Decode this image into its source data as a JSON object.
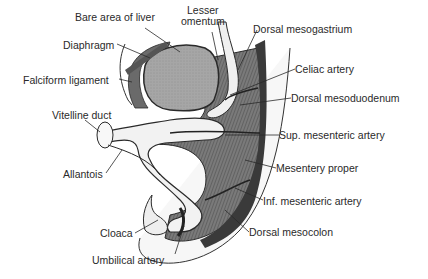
{
  "diagram": {
    "colors": {
      "background": "#ffffff",
      "line": "#2a2a2a",
      "liver": "#a8a8a8",
      "mesentery": "#6e6e6e",
      "gut_lumen": "#f2f2f2",
      "body_wall": "#f5f5f5"
    },
    "labels": [
      {
        "id": "bare-area-of-liver",
        "text": "Bare area of liver",
        "x": 75,
        "y": 17
      },
      {
        "id": "lesser-omentum-1",
        "text": "Lesser",
        "x": 187,
        "y": 10
      },
      {
        "id": "lesser-omentum-2",
        "text": "omentum",
        "x": 181,
        "y": 21
      },
      {
        "id": "dorsal-mesogastrium",
        "text": "Dorsal mesogastrium",
        "x": 253,
        "y": 23
      },
      {
        "id": "diaphragm",
        "text": "Diaphragm",
        "x": 63,
        "y": 38
      },
      {
        "id": "celiac-artery",
        "text": "Celiac artery",
        "x": 295,
        "y": 63
      },
      {
        "id": "falciform-ligament",
        "text": "Falciform ligament",
        "x": 23,
        "y": 73
      },
      {
        "id": "dorsal-mesoduodenum",
        "text": "Dorsal mesoduodenum",
        "x": 291,
        "y": 92
      },
      {
        "id": "vitelline-duct",
        "text": "Vitelline duct",
        "x": 52,
        "y": 108
      },
      {
        "id": "sup-mesenteric-artery",
        "text": "Sup. mesenteric artery",
        "x": 279,
        "y": 129
      },
      {
        "id": "mesentery-proper",
        "text": "Mesentery proper",
        "x": 276,
        "y": 162
      },
      {
        "id": "allantois",
        "text": "Allantois",
        "x": 63,
        "y": 168
      },
      {
        "id": "inf-mesenteric-artery",
        "text": "Inf. mesenteric artery",
        "x": 263,
        "y": 195
      },
      {
        "id": "cloaca",
        "text": "Cloaca",
        "x": 100,
        "y": 227
      },
      {
        "id": "dorsal-mesocolon",
        "text": "Dorsal mesocolon",
        "x": 249,
        "y": 226
      },
      {
        "id": "umbilical-artery",
        "text": "Umbilical artery",
        "x": 92,
        "y": 254
      }
    ]
  }
}
